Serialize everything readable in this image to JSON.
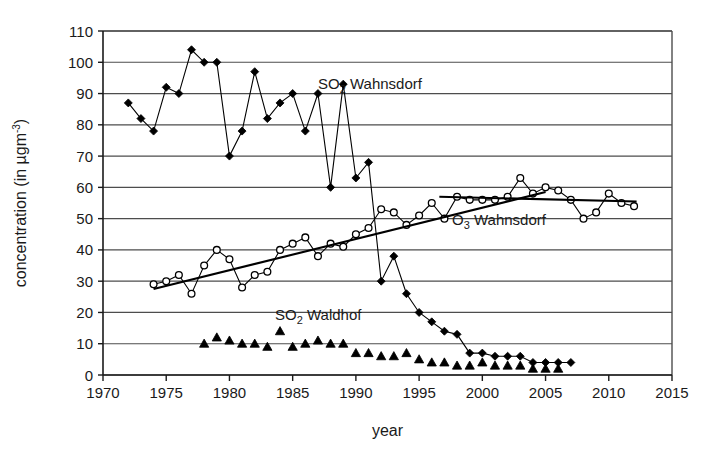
{
  "chart_data": {
    "type": "line",
    "title": "",
    "xlabel": "year",
    "ylabel": "concentration (in µgm-3)",
    "ylabel_parts": {
      "main": "concentration (in ",
      "unit_base": "µgm",
      "unit_exp": "-3",
      "close": ")"
    },
    "xlim": [
      1970,
      2015
    ],
    "ylim": [
      0,
      110
    ],
    "xticks": [
      1970,
      1975,
      1980,
      1985,
      1990,
      1995,
      2000,
      2005,
      2010,
      2015
    ],
    "yticks": [
      0,
      10,
      20,
      30,
      40,
      50,
      60,
      70,
      80,
      90,
      100,
      110
    ],
    "grid": "horizontal",
    "legend": "inline-annotations",
    "annotations": [
      {
        "name": "so2-wahnsdorf-label",
        "text_main": "SO",
        "text_sub": "2",
        "text_rest": " Wahnsdorf",
        "x": 1987.0,
        "y": 91.5
      },
      {
        "name": "o3-wahnsdorf-label",
        "text_main": "O",
        "text_sub": "3",
        "text_rest": " Wahnsdorf",
        "x": 1997.6,
        "y": 48.0
      },
      {
        "name": "so2-waldhof-label",
        "text_main": "SO",
        "text_sub": "2",
        "text_rest": " Waldhof",
        "x": 1983.6,
        "y": 17.5
      }
    ],
    "series": [
      {
        "name": "SO2 Wahnsdorf",
        "marker": "filled-diamond",
        "connected": true,
        "x": [
          1972,
          1973,
          1974,
          1975,
          1976,
          1977,
          1978,
          1979,
          1980,
          1981,
          1982,
          1983,
          1984,
          1985,
          1986,
          1987,
          1988,
          1989,
          1990,
          1991,
          1992,
          1993,
          1994,
          1995,
          1996,
          1997,
          1998,
          1999,
          2000,
          2001,
          2002,
          2003,
          2004,
          2005,
          2006,
          2007
        ],
        "values": [
          87,
          82,
          78,
          92,
          90,
          104,
          100,
          100,
          70,
          78,
          97,
          82,
          87,
          90,
          78,
          90,
          60,
          93,
          63,
          68,
          30,
          38,
          26,
          20,
          17,
          14,
          13,
          7,
          7,
          6,
          6,
          6,
          4,
          4,
          4,
          4
        ]
      },
      {
        "name": "O3 Wahnsdorf",
        "marker": "open-circle",
        "connected": true,
        "x": [
          1974,
          1975,
          1976,
          1977,
          1978,
          1979,
          1980,
          1981,
          1982,
          1983,
          1984,
          1985,
          1986,
          1987,
          1988,
          1989,
          1990,
          1991,
          1992,
          1993,
          1994,
          1995,
          1996,
          1997,
          1998,
          1999,
          2000,
          2001,
          2002,
          2003,
          2004,
          2005,
          2006,
          2007,
          2008,
          2009,
          2010,
          2011,
          2012
        ],
        "values": [
          29,
          30,
          32,
          26,
          35,
          40,
          37,
          28,
          32,
          33,
          40,
          42,
          44,
          38,
          42,
          41,
          45,
          47,
          53,
          52,
          48,
          51,
          55,
          50,
          57,
          56,
          56,
          56,
          57,
          63,
          58,
          60,
          59,
          56,
          50,
          52,
          58,
          55,
          54
        ]
      },
      {
        "name": "O3 Wahnsdorf trend (1974-2005)",
        "marker": "none",
        "type": "trend",
        "x": [
          1974.0,
          2005.0
        ],
        "values": [
          27.5,
          58.5
        ]
      },
      {
        "name": "O3 Wahnsdorf trend (1997-2012)",
        "marker": "none",
        "type": "trend",
        "x": [
          1996.6,
          2012.2
        ],
        "values": [
          57.0,
          55.5
        ]
      },
      {
        "name": "SO2 Waldhof",
        "marker": "filled-triangle",
        "connected": false,
        "x": [
          1978,
          1979,
          1980,
          1981,
          1982,
          1983,
          1984,
          1985,
          1986,
          1987,
          1988,
          1989,
          1990,
          1991,
          1992,
          1993,
          1994,
          1995,
          1996,
          1997,
          1998,
          1999,
          2000,
          2001,
          2002,
          2003,
          2004,
          2005,
          2006
        ],
        "values": [
          10,
          12,
          11,
          10,
          10,
          9,
          14,
          9,
          10,
          11,
          10,
          10,
          7,
          7,
          6,
          6,
          7,
          5,
          4,
          4,
          3,
          3,
          4,
          3,
          3,
          3,
          2,
          2,
          2
        ]
      }
    ]
  },
  "axes_geometry": {
    "plot_left": 103,
    "plot_right": 672,
    "plot_top": 31,
    "plot_bottom": 375
  }
}
